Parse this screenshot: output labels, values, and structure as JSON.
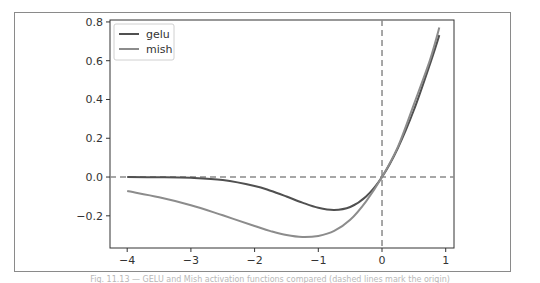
{
  "chart_data": {
    "type": "line",
    "title": "",
    "xlabel": "",
    "ylabel": "",
    "xlim": [
      -4.27,
      1.13
    ],
    "ylim": [
      -0.366,
      0.81
    ],
    "x_ticks": [
      -4,
      -3,
      -2,
      -1,
      0,
      1
    ],
    "x_tick_labels": [
      "−4",
      "−3",
      "−2",
      "−1",
      "0",
      "1"
    ],
    "y_ticks": [
      0.8,
      0.6,
      0.4,
      0.2,
      0.0,
      -0.2
    ],
    "y_tick_labels": [
      "0.8",
      "0.6",
      "0.4",
      "0.2",
      "0.0",
      "−0.2"
    ],
    "grid": false,
    "legend_position": "upper left",
    "reference_lines": [
      {
        "orientation": "horizontal",
        "value": 0.0,
        "style": "dashed"
      },
      {
        "orientation": "vertical",
        "value": 0.0,
        "style": "dashed"
      }
    ],
    "x": [
      -4.0,
      -3.5,
      -3.0,
      -2.5,
      -2.0,
      -1.75,
      -1.5,
      -1.25,
      -1.0,
      -0.75,
      -0.5,
      -0.25,
      0.0,
      0.25,
      0.5,
      0.75,
      0.9
    ],
    "series": [
      {
        "name": "gelu",
        "color": "#505050",
        "values": [
          -0.0001,
          -0.0008,
          -0.004,
          -0.0155,
          -0.0455,
          -0.0702,
          -0.1002,
          -0.132,
          -0.1587,
          -0.17,
          -0.1543,
          -0.1003,
          0.0,
          0.1497,
          0.3457,
          0.58,
          0.7319
        ]
      },
      {
        "name": "mish",
        "color": "#8c8c8c",
        "values": [
          -0.0727,
          -0.1043,
          -0.1456,
          -0.1975,
          -0.2525,
          -0.2786,
          -0.2997,
          -0.3092,
          -0.3034,
          -0.2775,
          -0.2207,
          -0.1249,
          0.0,
          0.156,
          0.3752,
          0.601,
          0.771
        ]
      }
    ]
  },
  "legend": {
    "items": [
      {
        "label": "gelu",
        "color": "#505050"
      },
      {
        "label": "mish",
        "color": "#8c8c8c"
      }
    ]
  },
  "caption": "Fig. 11.13 — GELU and Mish activation functions compared (dashed lines mark the origin)"
}
